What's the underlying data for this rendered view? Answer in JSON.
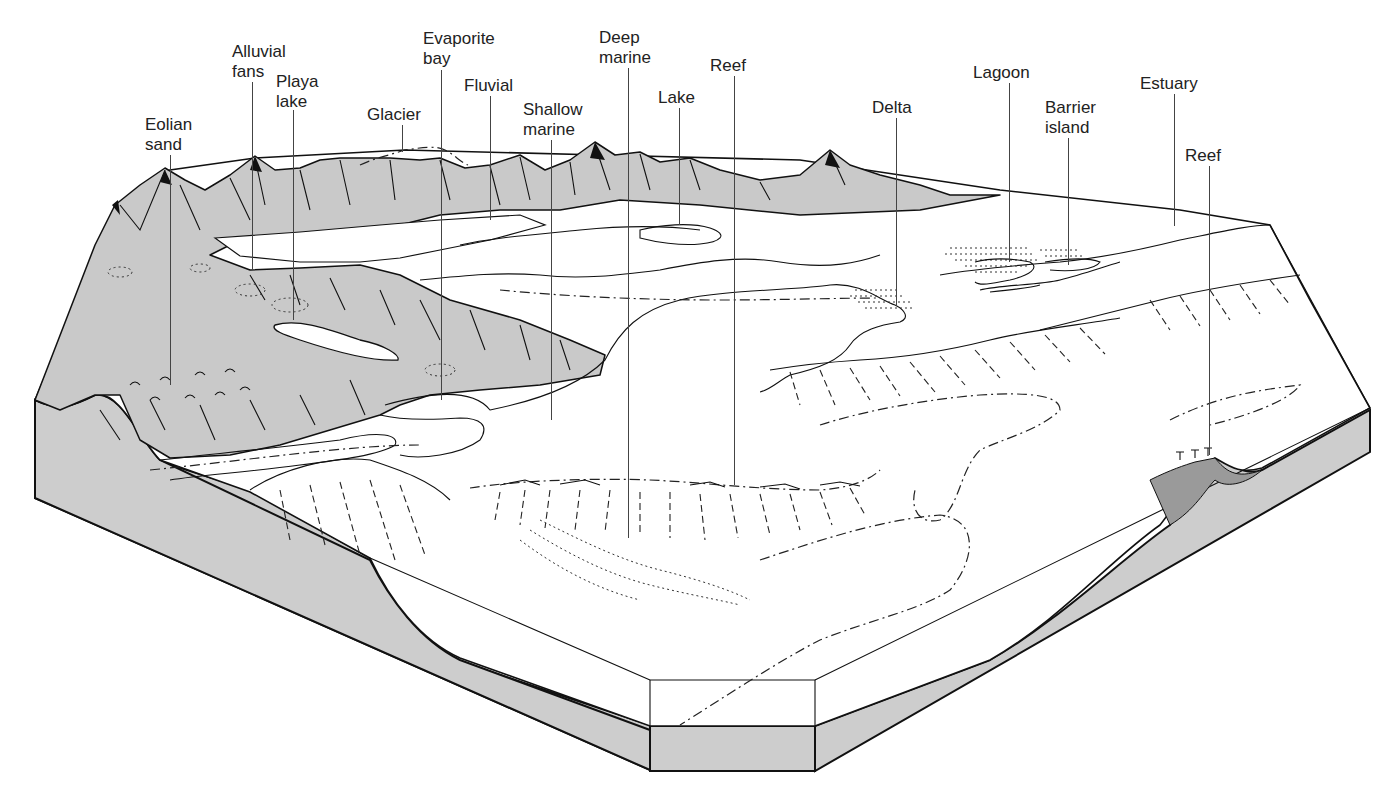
{
  "diagram": {
    "colors": {
      "land_fill": "#c9c9c9",
      "section_fill": "#cdcdcd",
      "water": "#ffffff",
      "ink": "#111111"
    },
    "labels": [
      {
        "id": "eolian-sand",
        "text": "Eolian\nsand",
        "x": 145,
        "y": 115,
        "leader_x": 170,
        "leader_top": 155,
        "leader_bottom": 385
      },
      {
        "id": "alluvial-fans",
        "text": "Alluvial\nfans",
        "x": 232,
        "y": 42,
        "leader_x": 252,
        "leader_top": 82,
        "leader_bottom": 270
      },
      {
        "id": "playa-lake",
        "text": "Playa\nlake",
        "x": 276,
        "y": 72,
        "leader_x": 293,
        "leader_top": 110,
        "leader_bottom": 320
      },
      {
        "id": "glacier",
        "text": "Glacier",
        "x": 367,
        "y": 105,
        "leader_x": 402,
        "leader_top": 125,
        "leader_bottom": 152
      },
      {
        "id": "evaporite-bay",
        "text": "Evaporite\nbay",
        "x": 423,
        "y": 29,
        "leader_x": 441,
        "leader_top": 70,
        "leader_bottom": 400
      },
      {
        "id": "fluvial",
        "text": "Fluvial",
        "x": 464,
        "y": 76,
        "leader_x": 490,
        "leader_top": 96,
        "leader_bottom": 220
      },
      {
        "id": "shallow-marine",
        "text": "Shallow\nmarine",
        "x": 523,
        "y": 100,
        "leader_x": 551,
        "leader_top": 140,
        "leader_bottom": 420
      },
      {
        "id": "deep-marine",
        "text": "Deep\nmarine",
        "x": 599,
        "y": 28,
        "leader_x": 628,
        "leader_top": 68,
        "leader_bottom": 538
      },
      {
        "id": "lake",
        "text": "Lake",
        "x": 658,
        "y": 88,
        "leader_x": 679,
        "leader_top": 108,
        "leader_bottom": 225
      },
      {
        "id": "reef-1",
        "text": "Reef",
        "x": 710,
        "y": 56,
        "leader_x": 734,
        "leader_top": 76,
        "leader_bottom": 485
      },
      {
        "id": "delta",
        "text": "Delta",
        "x": 872,
        "y": 98,
        "leader_x": 896,
        "leader_top": 118,
        "leader_bottom": 305
      },
      {
        "id": "lagoon",
        "text": "Lagoon",
        "x": 973,
        "y": 63,
        "leader_x": 1009,
        "leader_top": 83,
        "leader_bottom": 262
      },
      {
        "id": "barrier-island",
        "text": "Barrier\nisland",
        "x": 1045,
        "y": 98,
        "leader_x": 1068,
        "leader_top": 138,
        "leader_bottom": 265
      },
      {
        "id": "estuary",
        "text": "Estuary",
        "x": 1140,
        "y": 74,
        "leader_x": 1174,
        "leader_top": 94,
        "leader_bottom": 226
      },
      {
        "id": "reef-2",
        "text": "Reef",
        "x": 1185,
        "y": 146,
        "leader_x": 1209,
        "leader_top": 166,
        "leader_bottom": 455
      }
    ]
  }
}
